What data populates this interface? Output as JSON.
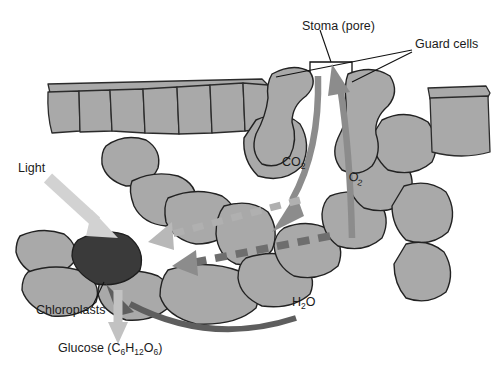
{
  "figure": {
    "background_color": "#ffffff"
  },
  "labels": {
    "stoma": "Stoma (pore)",
    "guard_cells": "Guard cells",
    "light": "Light",
    "chloroplasts": "Chloroplasts",
    "glucose_name": "Glucose (C",
    "glucose_sub1": "6",
    "glucose_mid1": "H",
    "glucose_sub2": "12",
    "glucose_mid2": "O",
    "glucose_sub3": "6",
    "glucose_close": ")",
    "co2_main": "CO",
    "co2_sub": "2",
    "o2_main": "O",
    "o2_sub": "2",
    "h2o_main": "H",
    "h2o_sub": "2",
    "h2o_end": "O"
  },
  "colors": {
    "cell_fill": "#a9a9a9",
    "cell_stroke": "#222222",
    "chloroplast_fill": "#3a3a3a",
    "arrow_gas": "#8c8c8c",
    "arrow_water": "#5e5e5e",
    "arrow_light": "#d2d2d2",
    "arrow_glucose": "#c2c2c2",
    "dash_light": "#b0b0b0",
    "dash_dark": "#6e6e6e",
    "text": "#1b1b1b"
  },
  "structures": {
    "upper_epidermis_cell_count": 7,
    "guard_cell_count": 2,
    "chloroplast_count": 1
  },
  "flows": [
    {
      "name": "light",
      "label": "Light",
      "direction": "into-leaf",
      "target": "chloroplast"
    },
    {
      "name": "co2",
      "label": "CO2",
      "direction": "into-leaf",
      "target": "mesophyll-airspace"
    },
    {
      "name": "o2",
      "label": "O2",
      "direction": "out-of-leaf",
      "target": "stoma"
    },
    {
      "name": "h2o",
      "label": "H2O",
      "direction": "into-leaf",
      "target": "chloroplast"
    },
    {
      "name": "glucose",
      "label": "Glucose",
      "direction": "out-of-cell",
      "target": "plant"
    }
  ]
}
